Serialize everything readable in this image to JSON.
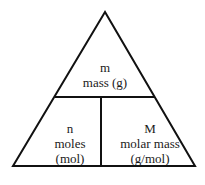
{
  "diagram": {
    "type": "formula-triangle",
    "stroke_color": "#111111",
    "top": {
      "symbol": "m",
      "description": "mass (g)"
    },
    "bottom_left": {
      "symbol": "n",
      "description": "moles",
      "unit": "(mol)"
    },
    "bottom_right": {
      "symbol": "M",
      "description": "molar mass",
      "unit": "(g/mol)"
    }
  }
}
